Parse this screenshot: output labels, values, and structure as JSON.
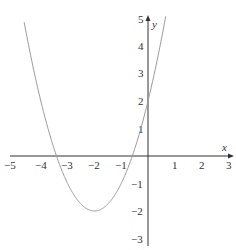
{
  "chart_data": {
    "type": "line",
    "title": "",
    "xlabel": "x",
    "ylabel": "y",
    "xlim": [
      -5,
      3
    ],
    "ylim": [
      -3,
      5
    ],
    "grid": false,
    "legend": null,
    "x_ticks": [
      "−5",
      "−4",
      "−3",
      "−2",
      "−1",
      "1",
      "2",
      "3"
    ],
    "y_ticks": [
      "5",
      "4",
      "3",
      "2",
      "1",
      "−1",
      "−2",
      "−3"
    ],
    "series": [
      {
        "name": "y = x² + 4x + 2",
        "function": "(x+2)^2 - 2",
        "vertex": [
          -2,
          -2
        ],
        "x": [
          -4.6,
          -4,
          -3.5,
          -3,
          -2.5,
          -2,
          -1.5,
          -1,
          -0.5,
          0,
          0.5,
          0.65
        ],
        "y": [
          4.76,
          2,
          0.25,
          -1,
          -1.75,
          -2,
          -1.75,
          -1,
          0.25,
          2,
          4.25,
          4.92
        ]
      }
    ],
    "colors": {
      "axis": "#333333",
      "curve": "#999999"
    }
  }
}
